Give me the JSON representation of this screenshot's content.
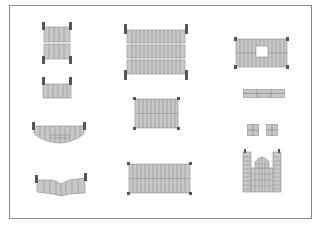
{
  "diagram": {
    "type": "architectural-elements-sheet",
    "colors": {
      "frame": "#8a8a8a",
      "panel_fill": "#c8c8c8",
      "panel_stroke": "#8c8c8c",
      "stripe": "#9a9a9a",
      "post": "#555555",
      "background": "#ffffff"
    },
    "elements": [
      {
        "id": "double-panel-vertical",
        "label": "stacked two-section panel with corner posts"
      },
      {
        "id": "single-panel-small",
        "label": "single-section panel with top posts"
      },
      {
        "id": "curved-panel-shallow",
        "label": "shallow curved bottom panel"
      },
      {
        "id": "curved-panel-wave",
        "label": "wave curved bottom panel"
      },
      {
        "id": "triple-panel-large",
        "label": "large three-row panel with posts"
      },
      {
        "id": "double-row-panel-medium",
        "label": "medium two-row panel with corner posts"
      },
      {
        "id": "double-row-panel-wide",
        "label": "wide two-row panel with corner posts"
      },
      {
        "id": "panel-with-opening",
        "label": "panel with square opening"
      },
      {
        "id": "thin-strip-panel",
        "label": "thin horizontal strip panel"
      },
      {
        "id": "small-square-tiles",
        "label": "pair of small square grid tiles"
      },
      {
        "id": "gate-with-arch",
        "label": "gate structure with arched top and towers"
      }
    ]
  }
}
